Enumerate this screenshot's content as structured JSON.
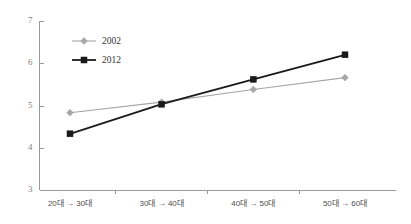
{
  "chart_data": {
    "type": "line",
    "title": "",
    "xlabel": "",
    "ylabel": "",
    "categories": [
      "20대 → 30대",
      "30대 → 40대",
      "40대 → 50대",
      "50대 → 60대"
    ],
    "series": [
      {
        "name": "2002",
        "values": [
          4.83,
          5.08,
          5.38,
          5.66
        ],
        "color": "#a6a6a6",
        "marker": "diamond"
      },
      {
        "name": "2012",
        "values": [
          4.33,
          5.03,
          5.62,
          6.2
        ],
        "color": "#1a1a1a",
        "marker": "square"
      }
    ],
    "ylim": [
      3,
      7
    ],
    "yticks": [
      "3",
      "4",
      "5",
      "6",
      "7"
    ],
    "ytick_values": [
      3,
      4,
      5,
      6,
      7
    ],
    "grid": false,
    "legend_position": "top-left"
  },
  "legend": {
    "entries": [
      {
        "label": "2002"
      },
      {
        "label": "2012"
      }
    ]
  },
  "axis": {
    "y_ticks": [
      "7",
      "6",
      "5",
      "4",
      "3"
    ],
    "x_ticks": [
      "20대 → 30대",
      "30대 → 40대",
      "40대 → 50대",
      "50대 → 60대"
    ]
  }
}
